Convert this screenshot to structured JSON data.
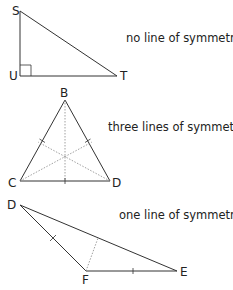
{
  "figures": [
    {
      "id": "right-triangle",
      "vertices": {
        "S": "S",
        "U": "U",
        "T": "T"
      },
      "caption": "no line of symmetry",
      "lines_of_symmetry": 0
    },
    {
      "id": "equilateral-triangle",
      "vertices": {
        "B": "B",
        "C": "C",
        "D": "D"
      },
      "caption": "three lines of symmetry",
      "lines_of_symmetry": 3
    },
    {
      "id": "isosceles-triangle",
      "vertices": {
        "D": "D",
        "F": "F",
        "E": "E"
      },
      "caption": "one line of symmetry",
      "lines_of_symmetry": 1
    }
  ],
  "colors": {
    "stroke": "#333333",
    "dotted": "#888888"
  }
}
